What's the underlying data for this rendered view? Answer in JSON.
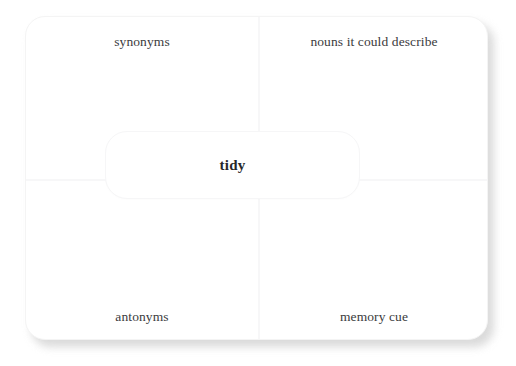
{
  "worksheet": {
    "type": "frayer-model",
    "term": "tidy",
    "card": {
      "background_color": "#ffffff",
      "shadow_color": "#d4d4d4",
      "divider_color": "#f7f7f8"
    },
    "center": {
      "term": "tidy",
      "text_color": "#27272a"
    },
    "quadrants": [
      {
        "position": "top-left",
        "label": "synonyms"
      },
      {
        "position": "top-right",
        "label": "nouns it could describe"
      },
      {
        "position": "bottom-left",
        "label": "antonyms"
      },
      {
        "position": "bottom-right",
        "label": "memory cue"
      }
    ],
    "label_color": "#3b3b3d"
  }
}
